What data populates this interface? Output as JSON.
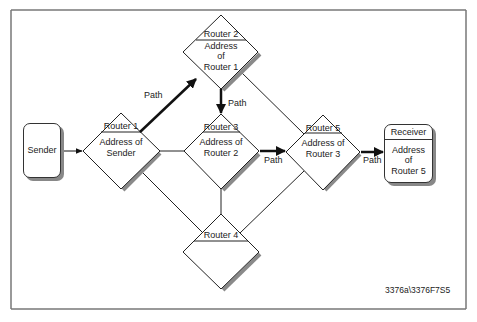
{
  "diagram": {
    "type": "network routing path diagram",
    "frame": {
      "border_color": "#777777"
    },
    "nodes": {
      "sender": {
        "label": "Sender"
      },
      "router1": {
        "title": "Router 1",
        "body_line1": "Address of",
        "body_line2": "Sender"
      },
      "router2": {
        "title": "Router 2",
        "body_line1": "Address",
        "body_line2": "of",
        "body_line3": "Router 1"
      },
      "router3": {
        "title": "Router 3",
        "body_line1": "Address of",
        "body_line2": "Router 2"
      },
      "router4": {
        "title": "Router 4"
      },
      "router5": {
        "title": "Router 5",
        "body_line1": "Address of",
        "body_line2": "Router 3"
      },
      "receiver": {
        "title": "Receiver",
        "body_line1": "Address",
        "body_line2": "of",
        "body_line3": "Router 5"
      }
    },
    "edges": [
      {
        "from": "Sender",
        "to": "Router 1",
        "style": "thin-arrow"
      },
      {
        "from": "Router 1",
        "to": "Router 2",
        "style": "bold-arrow",
        "label": "Path"
      },
      {
        "from": "Router 2",
        "to": "Router 3",
        "style": "bold-arrow",
        "label": "Path"
      },
      {
        "from": "Router 3",
        "to": "Router 5",
        "style": "bold-arrow",
        "label": "Path"
      },
      {
        "from": "Router 5",
        "to": "Receiver",
        "style": "bold-arrow",
        "label": "Path"
      },
      {
        "from": "Router 1",
        "to": "Router 3",
        "style": "line"
      },
      {
        "from": "Router 1",
        "to": "Router 4",
        "style": "line"
      },
      {
        "from": "Router 2",
        "to": "Router 5",
        "style": "line"
      },
      {
        "from": "Router 3",
        "to": "Router 4",
        "style": "line"
      },
      {
        "from": "Router 5",
        "to": "Router 4",
        "style": "line"
      }
    ],
    "path_labels": {
      "p1": "Path",
      "p2": "Path",
      "p3": "Path",
      "p4": "Path"
    },
    "figure_id": "3376a\\3376F7S5"
  }
}
